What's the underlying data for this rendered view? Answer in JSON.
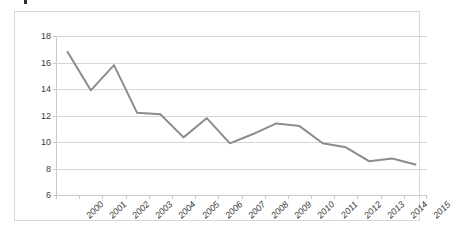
{
  "chart_data": {
    "type": "line",
    "title": "",
    "subtitle": "",
    "xlabel": "",
    "ylabel": "",
    "categories": [
      "2000",
      "2001",
      "2002",
      "2003",
      "2004",
      "2005",
      "2006",
      "2007",
      "2008",
      "2009",
      "2010",
      "2011",
      "2012",
      "2013",
      "2014",
      "2015"
    ],
    "values": [
      16.8,
      13.9,
      15.8,
      12.2,
      12.1,
      10.35,
      11.8,
      9.9,
      10.6,
      11.4,
      11.2,
      9.9,
      9.6,
      8.55,
      8.75,
      8.3
    ],
    "series": [
      {
        "name": "",
        "values": [
          16.8,
          13.9,
          15.8,
          12.2,
          12.1,
          10.35,
          11.8,
          9.9,
          10.6,
          11.4,
          11.2,
          9.9,
          9.6,
          8.55,
          8.75,
          8.3
        ]
      }
    ],
    "ylim": [
      6,
      18
    ],
    "ytick_values": [
      6,
      8,
      10,
      12,
      14,
      16,
      18
    ],
    "ytick_labels": [
      "6",
      "8",
      "10",
      "12",
      "14",
      "16",
      "18"
    ],
    "ytick_step": 2,
    "grid": {
      "horizontal": true,
      "vertical": false
    },
    "legend": {
      "visible": false,
      "position": "none",
      "entries": []
    },
    "markers": false,
    "annotations": [],
    "colors": {
      "line": "#8c8c8c",
      "gridline": "#d6d6d6",
      "axis": "#c9c9c9",
      "frame_border": "#d9d9d9",
      "tick_text": "#3a3a3a",
      "background": "#ffffff"
    },
    "x_label_rotation_deg": -45
  }
}
